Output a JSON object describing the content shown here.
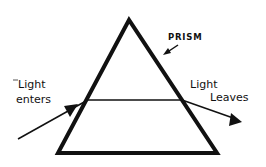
{
  "diagram": {
    "labels": {
      "prism": "PRISM",
      "light_enters_line1": "Light",
      "light_enters_line2": "enters",
      "light_leaves_line1": "Light",
      "light_leaves_line2": "Leaves"
    },
    "colors": {
      "ink": "#111111",
      "background": "#ffffff"
    }
  }
}
